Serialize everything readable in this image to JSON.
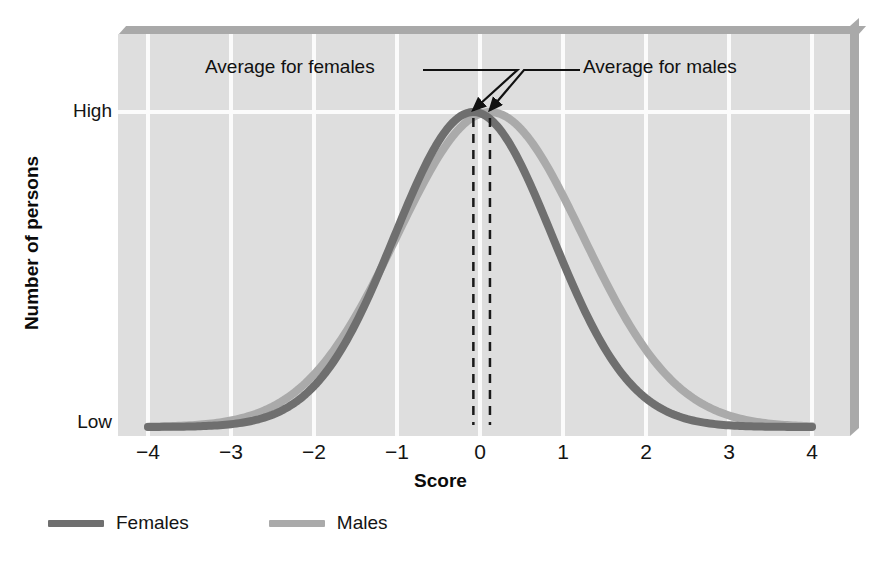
{
  "chart_data": {
    "type": "line",
    "title": "",
    "xlabel": "Score",
    "ylabel": "Number of persons",
    "xlim": [
      -4,
      4
    ],
    "ylim": [
      0,
      1
    ],
    "grid": true,
    "legend_position": "bottom-left",
    "x_ticks": [
      "−4",
      "−3",
      "−2",
      "−1",
      "0",
      "1",
      "2",
      "3",
      "4"
    ],
    "x_tick_values": [
      -4,
      -3,
      -2,
      -1,
      0,
      1,
      2,
      3,
      4
    ],
    "y_ticks": [
      "High",
      "Low"
    ],
    "y_tick_values": [
      1.0,
      0.0
    ],
    "series": [
      {
        "name": "Females",
        "color": "#6f6f6f",
        "mean": -0.08,
        "sd": 0.95,
        "peak_label": "High",
        "x": [
          -4,
          -3.5,
          -3,
          -2.5,
          -2,
          -1.5,
          -1,
          -0.5,
          -0.08,
          0,
          0.5,
          1,
          1.5,
          2,
          2.5,
          3,
          3.5,
          4
        ],
        "y": [
          0.0,
          0.01,
          0.02,
          0.05,
          0.12,
          0.27,
          0.5,
          0.83,
          1.0,
          0.997,
          0.88,
          0.58,
          0.3,
          0.13,
          0.05,
          0.02,
          0.0,
          0.0
        ]
      },
      {
        "name": "Males",
        "color": "#aaaaaa",
        "mean": 0.12,
        "sd": 1.12,
        "peak_label": "High",
        "x": [
          -4,
          -3.5,
          -3,
          -2.5,
          -2,
          -1.5,
          -1,
          -0.5,
          0,
          0.12,
          0.5,
          1,
          1.5,
          2,
          2.5,
          3,
          3.5,
          4
        ],
        "y": [
          0.0,
          0.01,
          0.03,
          0.07,
          0.15,
          0.3,
          0.5,
          0.74,
          0.94,
          1.0,
          0.94,
          0.74,
          0.49,
          0.28,
          0.13,
          0.05,
          0.02,
          0.0
        ]
      }
    ],
    "annotations": [
      {
        "name": "average-for-females",
        "label": "Average for females",
        "points_to_x": -0.08,
        "points_to_y": 1.0,
        "marker": "dashed-vertical-line"
      },
      {
        "name": "average-for-males",
        "label": "Average for males",
        "points_to_x": 0.12,
        "points_to_y": 1.0,
        "marker": "dashed-vertical-line"
      }
    ]
  },
  "axes": {
    "y_title": "Number of persons",
    "y_high_label": "High",
    "y_low_label": "Low",
    "x_title": "Score",
    "x_tick_labels": [
      "−4",
      "−3",
      "−2",
      "−1",
      "0",
      "1",
      "2",
      "3",
      "4"
    ]
  },
  "annotations": {
    "females": "Average for females",
    "males": "Average for males"
  },
  "legend": {
    "items": [
      {
        "label": "Females",
        "color": "#6f6f6f"
      },
      {
        "label": "Males",
        "color": "#aaaaaa"
      }
    ]
  },
  "colors": {
    "panel_background": "#dedede",
    "gridline": "#fbfbfb",
    "panel_shadow": "#a9a9a9",
    "females_curve": "#6f6f6f",
    "males_curve": "#aaaaaa",
    "text": "#111111",
    "page_background": "#ffffff"
  }
}
